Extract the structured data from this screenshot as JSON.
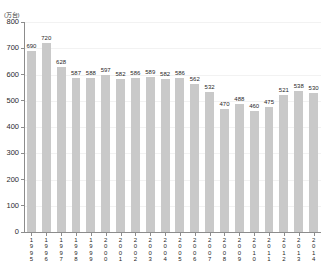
{
  "chart_data": {
    "type": "bar",
    "title": "",
    "subtitle": "",
    "unit_label": "(万台)",
    "xlabel": "",
    "ylabel": "",
    "ylim": [
      0,
      800
    ],
    "ytick_values": [
      800,
      700,
      600,
      500,
      400,
      300,
      200,
      100,
      0
    ],
    "ytick_labels": [
      "800",
      "700",
      "600",
      "500",
      "400",
      "300",
      "200",
      "100",
      "0"
    ],
    "grid": "horizontal-faint",
    "legend": "none",
    "bar_color": "#c9c9c9",
    "axis_color": "#8c8c8c",
    "categories": [
      "1995",
      "1996",
      "1997",
      "1998",
      "1999",
      "2000",
      "2001",
      "2002",
      "2003",
      "2004",
      "2005",
      "2006",
      "2007",
      "2008",
      "2009",
      "2010",
      "2011",
      "2012",
      "2013",
      "2014"
    ],
    "values": [
      690,
      720,
      628,
      587,
      588,
      597,
      582,
      586,
      589,
      582,
      586,
      562,
      532,
      470,
      488,
      460,
      475,
      521,
      538,
      530
    ],
    "value_labels": [
      "690",
      "720",
      "628",
      "587",
      "588",
      "597",
      "582",
      "586",
      "589",
      "582",
      "586",
      "562",
      "532",
      "470",
      "488",
      "460",
      "475",
      "521",
      "538",
      "530"
    ]
  }
}
